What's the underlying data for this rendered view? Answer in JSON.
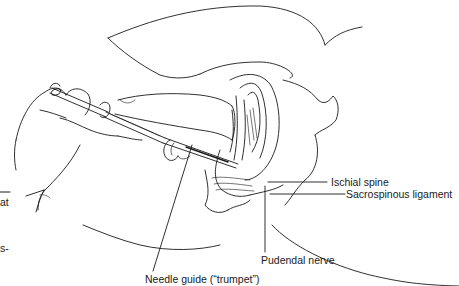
{
  "figure": {
    "labels": {
      "ischial_spine": "Ischial spine",
      "sacrospinous_ligament": "Sacrospinous ligament",
      "pudendal_nerve": "Pudendal nerve",
      "needle_guide": "Needle guide (“trumpet”)"
    },
    "margin_fragments": {
      "line1": "at",
      "line2": "s-"
    },
    "colors": {
      "ink": "#1a1a1a",
      "background": "#ffffff"
    }
  }
}
